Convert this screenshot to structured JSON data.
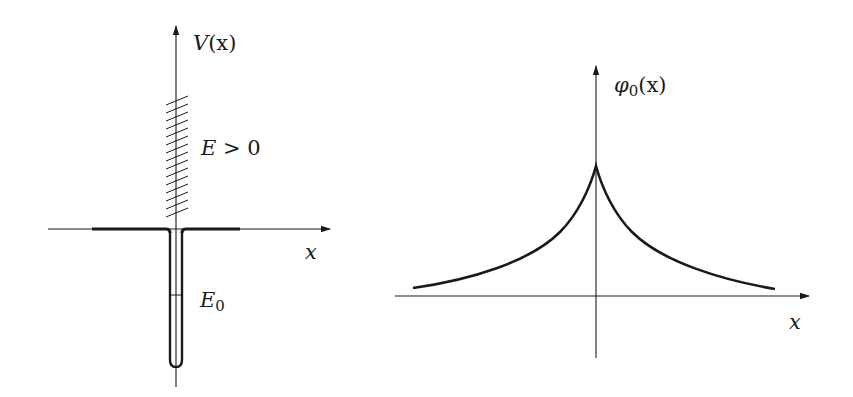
{
  "figure": {
    "left_panel": {
      "title": "delta-function potential well",
      "y_axis_label_main": "V",
      "y_axis_label_arg": "(x)",
      "x_axis_label": "x",
      "continuum_label_var": "E",
      "continuum_label_rel": " > 0",
      "continuum_label_value": "0",
      "bound_state_label_var": "E",
      "bound_state_label_sub": "0"
    },
    "right_panel": {
      "title": "ground-state wavefunction",
      "y_axis_label_main": "φ",
      "y_axis_label_sub": "0",
      "y_axis_label_arg": "(x)",
      "x_axis_label": "x",
      "curve": "exponential cusp, φ0(x) ∝ exp(-κ|x|)"
    },
    "colors": {
      "ink": "#1a1a1a",
      "background": "#ffffff"
    }
  }
}
